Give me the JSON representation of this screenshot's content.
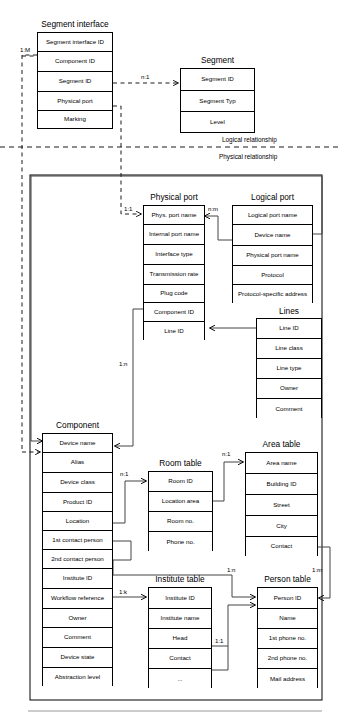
{
  "diagram": {
    "kind": "entity-relationship-diagram",
    "zones": {
      "logical_label": "Logical relationship",
      "physical_label": "Physical relationship"
    }
  },
  "entities": {
    "segment_interface": {
      "title": "Segment interface",
      "attributes": [
        "Segment interface ID",
        "Component ID",
        "Segment ID",
        "Physical port",
        "Marking"
      ]
    },
    "segment": {
      "title": "Segment",
      "attributes": [
        "Segment ID",
        "Segment Typ",
        "Level"
      ]
    },
    "physical_port": {
      "title": "Physical port",
      "attributes": [
        "Phys. port name",
        "Internal port name",
        "Interface type",
        "Transmission rate",
        "Plug code",
        "Component ID",
        "Line ID"
      ]
    },
    "logical_port": {
      "title": "Logical port",
      "attributes": [
        "Logical port name",
        "Device name",
        "Physical port name",
        "Protocol",
        "Protocol-specific address"
      ]
    },
    "lines": {
      "title": "Lines",
      "attributes": [
        "Line ID",
        "Line class",
        "Line type",
        "Owner",
        "Comment"
      ]
    },
    "component": {
      "title": "Component",
      "attributes": [
        "Device name",
        "Alias",
        "Device class",
        "Product ID",
        "Location",
        "1st contact person",
        "2nd contact person",
        "Institute ID",
        "Workflow reference",
        "Owner",
        "Comment",
        "Device state",
        "Abstraction level"
      ]
    },
    "room_table": {
      "title": "Room table",
      "attributes": [
        "Room ID",
        "Location area",
        "Room no.",
        "Phone no."
      ]
    },
    "area_table": {
      "title": "Area table",
      "attributes": [
        "Area name",
        "Building ID",
        "Street",
        "City",
        "Contact"
      ]
    },
    "institute_table": {
      "title": "Institute table",
      "attributes": [
        "Institute ID",
        "Institute name",
        "Head",
        "Contact",
        "..."
      ]
    },
    "person_table": {
      "title": "Person table",
      "attributes": [
        "Person ID",
        "Name",
        "1st phone no.",
        "2nd phone no.",
        "Mail address"
      ]
    }
  },
  "cardinalities": {
    "segiface_component": "1:M",
    "segiface_segment": "n:1",
    "segiface_physport": "1:1",
    "physport_logport": "n:m",
    "physport_component": "1:n",
    "component_room": "n:1",
    "room_area": "n:1",
    "component_institute": "1:k",
    "component_person": "1:n",
    "institute_person": "1:1",
    "area_person": "1:m"
  }
}
